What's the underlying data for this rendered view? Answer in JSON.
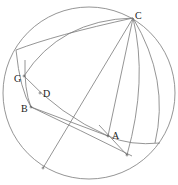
{
  "diagram": {
    "type": "spherical-geometry",
    "stroke_color": "#7a7a7a",
    "label_color": "#222222",
    "labels": {
      "C": "C",
      "G": "G",
      "D": "D",
      "B": "B",
      "A": "A"
    },
    "points": {
      "C": [
        133,
        18
      ],
      "G": [
        24,
        76
      ],
      "D": [
        40,
        93
      ],
      "B": [
        31,
        107
      ],
      "A": [
        108,
        136
      ],
      "E": [
        127,
        155
      ],
      "F": [
        43,
        168
      ]
    }
  }
}
